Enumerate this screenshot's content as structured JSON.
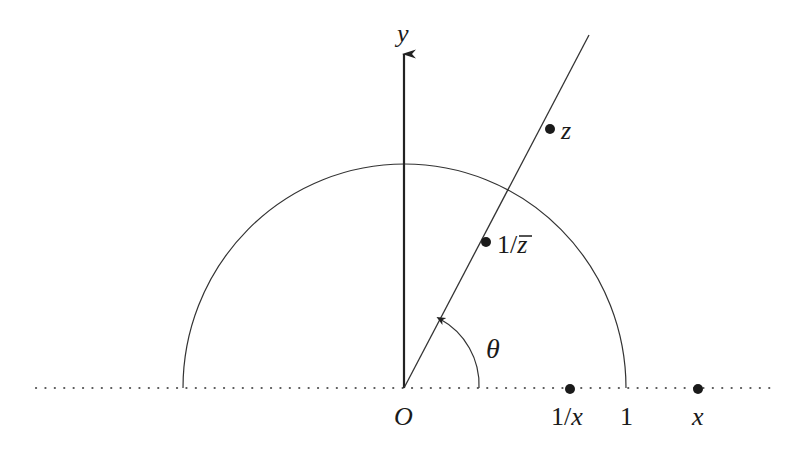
{
  "figure": {
    "labels": {
      "y_axis": "y",
      "origin": "O",
      "z": "z",
      "inv_conj_z_prefix": "1/",
      "inv_conj_z_var": "z",
      "theta": "θ",
      "inv_x_prefix": "1/",
      "inv_x_var": "x",
      "one": "1",
      "x": "x"
    },
    "colors": {
      "stroke": "#333333",
      "point": "#1a1a1a",
      "dots": "#555555"
    }
  }
}
